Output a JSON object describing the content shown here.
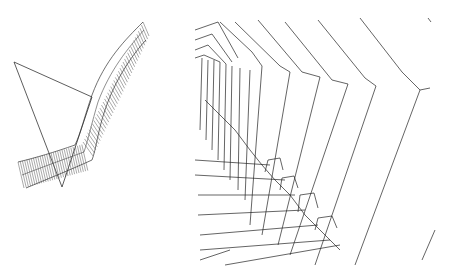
{
  "figure": {
    "panels": [
      {
        "id": "left",
        "description": "wireframe tube swept along a bent path with a triangle outline"
      },
      {
        "id": "right",
        "description": "interior perspective view of a polygonal wireframe tunnel"
      }
    ],
    "colors": {
      "background": "#ffffff",
      "line": "#222222",
      "mesh": "#555555"
    }
  }
}
